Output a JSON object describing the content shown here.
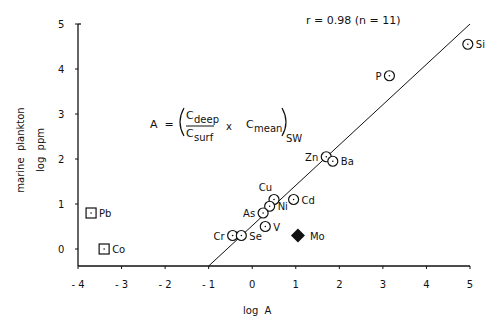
{
  "chart_data": {
    "type": "scatter",
    "title": "",
    "xlabel": "log  A",
    "ylabel_lines": [
      "marine  plankton",
      "log  ppm"
    ],
    "xlim": [
      -4,
      5
    ],
    "ylim": [
      -0.4,
      5
    ],
    "x_ticks": [
      -4,
      -3,
      -2,
      -1,
      0,
      1,
      2,
      3,
      4,
      5
    ],
    "x_tick_labels": [
      "- 4",
      "- 3",
      "- 2",
      "- 1",
      "0",
      "1",
      "2",
      "3",
      "4",
      "5"
    ],
    "y_ticks": [
      0,
      1,
      2,
      3,
      4,
      5
    ],
    "y_tick_labels": [
      "0",
      "1",
      "2",
      "3",
      "4",
      "5"
    ],
    "grid": false,
    "annotation_stats": "r = 0.98  (n = 11)",
    "formula": {
      "lhs": "A  =",
      "num": "C",
      "num_sub": "deep",
      "den": "C",
      "den_sub": "surf",
      "times": "x",
      "mean": "C",
      "mean_sub": "mean",
      "outer_sub": "SW"
    },
    "regression_line": {
      "x": [
        -1.0,
        5.0
      ],
      "y": [
        -0.4,
        5.0
      ]
    },
    "series": [
      {
        "name": "included",
        "marker": "circle-dot",
        "points": [
          {
            "label": "Si",
            "x": 4.95,
            "y": 4.55,
            "label_pos": "right"
          },
          {
            "label": "P",
            "x": 3.15,
            "y": 3.85,
            "label_pos": "left"
          },
          {
            "label": "Zn",
            "x": 1.7,
            "y": 2.05,
            "label_pos": "left"
          },
          {
            "label": "Ba",
            "x": 1.85,
            "y": 1.95,
            "label_pos": "right"
          },
          {
            "label": "Cu",
            "x": 0.5,
            "y": 1.1,
            "label_pos": "top"
          },
          {
            "label": "Cd",
            "x": 0.95,
            "y": 1.1,
            "label_pos": "right"
          },
          {
            "label": "Ni",
            "x": 0.4,
            "y": 0.95,
            "label_pos": "right"
          },
          {
            "label": "As",
            "x": 0.25,
            "y": 0.8,
            "label_pos": "left"
          },
          {
            "label": "V",
            "x": 0.3,
            "y": 0.5,
            "label_pos": "right"
          },
          {
            "label": "Cr",
            "x": -0.45,
            "y": 0.3,
            "label_pos": "left"
          },
          {
            "label": "Se",
            "x": -0.25,
            "y": 0.3,
            "label_pos": "right"
          }
        ]
      },
      {
        "name": "excluded-square",
        "marker": "square-dot",
        "points": [
          {
            "label": "Pb",
            "x": -3.7,
            "y": 0.8,
            "label_pos": "right"
          },
          {
            "label": "Co",
            "x": -3.4,
            "y": 0.0,
            "label_pos": "right"
          }
        ]
      },
      {
        "name": "excluded-diamond",
        "marker": "filled-diamond",
        "points": [
          {
            "label": "Mo",
            "x": 1.05,
            "y": 0.3,
            "label_pos": "right"
          }
        ]
      }
    ]
  }
}
